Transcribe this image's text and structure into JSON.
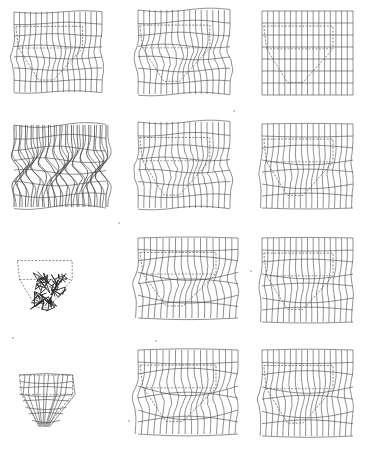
{
  "figure": {
    "rows": 4,
    "cols": 3,
    "line_color": "#444444",
    "dash_color": "#555555",
    "grid": {
      "columns": 16,
      "rows": 7
    },
    "panels": [
      {
        "row": 0,
        "col": 0,
        "x": 14,
        "y": 12,
        "w": 88,
        "h": 80,
        "style": "wavy",
        "amp": 4,
        "mesh": "full",
        "outline": true
      },
      {
        "row": 0,
        "col": 1,
        "x": 138,
        "y": 10,
        "w": 92,
        "h": 84,
        "style": "wavy",
        "amp": 6,
        "mesh": "full",
        "outline": true
      },
      {
        "row": 0,
        "col": 2,
        "x": 262,
        "y": 11,
        "w": 91,
        "h": 84,
        "style": "regular",
        "amp": 0,
        "mesh": "full",
        "outline": true
      },
      {
        "row": 1,
        "col": 0,
        "x": 14,
        "y": 125,
        "w": 92,
        "h": 82,
        "style": "wavy-dense",
        "amp": 8,
        "mesh": "full",
        "outline": false
      },
      {
        "row": 1,
        "col": 1,
        "x": 138,
        "y": 122,
        "w": 92,
        "h": 86,
        "style": "wavy",
        "amp": 6,
        "mesh": "full",
        "outline": true
      },
      {
        "row": 1,
        "col": 2,
        "x": 262,
        "y": 124,
        "w": 91,
        "h": 84,
        "style": "shear-light",
        "amp": 3,
        "mesh": "full",
        "outline": true
      },
      {
        "row": 2,
        "col": 0,
        "x": 16,
        "y": 248,
        "w": 72,
        "h": 70,
        "style": "collapsed",
        "amp": 0,
        "mesh": "clusters",
        "outline": true
      },
      {
        "row": 2,
        "col": 1,
        "x": 138,
        "y": 238,
        "w": 100,
        "h": 80,
        "style": "shear",
        "amp": 5,
        "mesh": "full",
        "outline": true
      },
      {
        "row": 2,
        "col": 2,
        "x": 262,
        "y": 238,
        "w": 91,
        "h": 84,
        "style": "shear-light",
        "amp": 3,
        "mesh": "full",
        "outline": true
      },
      {
        "row": 3,
        "col": 0,
        "x": 18,
        "y": 362,
        "w": 70,
        "h": 72,
        "style": "hopper-mesh",
        "amp": 0,
        "mesh": "hopper",
        "outline": true
      },
      {
        "row": 3,
        "col": 1,
        "x": 138,
        "y": 350,
        "w": 100,
        "h": 84,
        "style": "shear",
        "amp": 6,
        "mesh": "full",
        "outline": true
      },
      {
        "row": 3,
        "col": 2,
        "x": 262,
        "y": 350,
        "w": 91,
        "h": 86,
        "style": "shear-light",
        "amp": 4,
        "mesh": "full",
        "outline": true
      }
    ],
    "specks": [
      [
        12,
        337
      ],
      [
        118,
        222
      ],
      [
        128,
        420
      ],
      [
        233,
        110
      ],
      [
        250,
        270
      ],
      [
        155,
        340
      ]
    ]
  }
}
